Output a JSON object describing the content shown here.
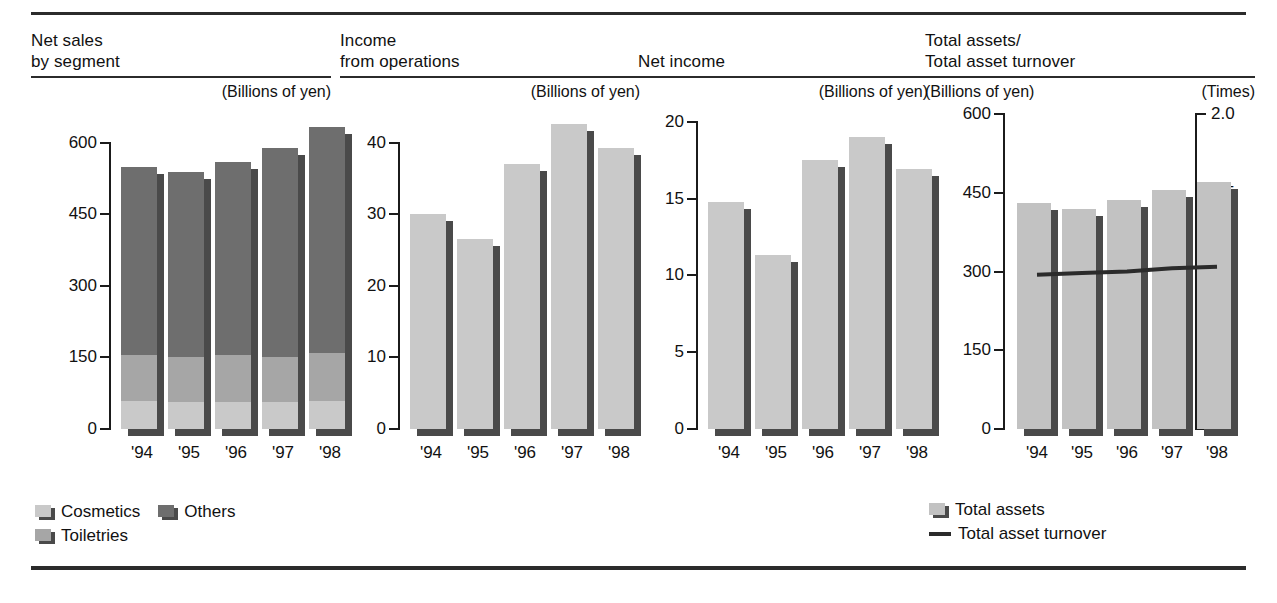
{
  "colors": {
    "cosmetics": "#c9c9c9",
    "toiletries": "#a6a6a6",
    "others": "#6e6e6e",
    "total_assets": "#c2c2c2",
    "bar_default": "#c9c9c9",
    "shadow": "#4a4a4a",
    "line": "#2b2b2b",
    "rule": "#2b2b2b"
  },
  "panels": [
    {
      "id": "net-sales-by-segment",
      "title": "Net sales\nby segment",
      "unit_left": "",
      "unit_right": "(Billions of yen)"
    },
    {
      "id": "income-from-operations",
      "title": "Income\nfrom operations",
      "unit_left": "",
      "unit_right": "(Billions of yen)"
    },
    {
      "id": "net-income",
      "title": "Net income",
      "unit_left": "",
      "unit_right": "(Billions of yen)"
    },
    {
      "id": "total-assets-turnover",
      "title": "Total assets/\nTotal asset turnover",
      "unit_left": "(Billions of yen)",
      "unit_right": "(Times)"
    }
  ],
  "legend1": {
    "items": [
      {
        "label": "Cosmetics",
        "swatch": "cosmetics"
      },
      {
        "label": "Others",
        "swatch": "others"
      },
      {
        "label": "Toiletries",
        "swatch": "toiletries"
      }
    ]
  },
  "legend4": {
    "items": [
      {
        "label": "Total assets",
        "swatch": "total_assets"
      },
      {
        "label": "Total asset turnover",
        "swatch": "line"
      }
    ]
  },
  "chart_data": [
    {
      "type": "bar",
      "stacked": true,
      "title": "Net sales by segment",
      "xlabel": "",
      "ylabel": "(Billions of yen)",
      "categories": [
        "'94",
        "'95",
        "'96",
        "'97",
        "'98"
      ],
      "yticks": [
        0,
        150,
        300,
        450,
        600
      ],
      "ylim": [
        0,
        660
      ],
      "grid": false,
      "legend_position": "bottom-left",
      "series": [
        {
          "name": "Cosmetics",
          "values": [
            58,
            56,
            56,
            56,
            59
          ]
        },
        {
          "name": "Toiletries",
          "values": [
            98,
            94,
            99,
            95,
            101
          ]
        },
        {
          "name": "Others",
          "values": [
            392,
            388,
            404,
            437,
            472
          ]
        }
      ],
      "totals": [
        548,
        538,
        559,
        588,
        632
      ]
    },
    {
      "type": "bar",
      "stacked": false,
      "title": "Income from operations",
      "xlabel": "",
      "ylabel": "(Billions of yen)",
      "categories": [
        "'94",
        "'95",
        "'96",
        "'97",
        "'98"
      ],
      "yticks": [
        0,
        10,
        20,
        30,
        40
      ],
      "ylim": [
        0,
        44
      ],
      "grid": false,
      "series": [
        {
          "name": "Income from operations",
          "values": [
            30.1,
            26.6,
            37.0,
            42.6,
            39.2
          ]
        }
      ]
    },
    {
      "type": "bar",
      "stacked": false,
      "title": "Net income",
      "xlabel": "",
      "ylabel": "(Billions of yen)",
      "categories": [
        "'94",
        "'95",
        "'96",
        "'97",
        "'98"
      ],
      "yticks": [
        0,
        5,
        10,
        15,
        20
      ],
      "ylim": [
        0,
        20.5
      ],
      "grid": false,
      "series": [
        {
          "name": "Net income",
          "values": [
            14.8,
            11.3,
            17.5,
            19.0,
            16.9
          ]
        }
      ]
    },
    {
      "type": "bar",
      "stacked": false,
      "combo": "line",
      "title": "Total assets / Total asset turnover",
      "xlabel": "",
      "ylabel": "(Billions of yen)",
      "y2label": "(Times)",
      "categories": [
        "'94",
        "'95",
        "'96",
        "'97",
        "'98"
      ],
      "yticks": [
        0,
        150,
        300,
        450,
        600
      ],
      "ylim": [
        0,
        600
      ],
      "y2ticks": [
        0,
        0.5,
        1.0,
        1.5,
        2.0
      ],
      "y2lim": [
        0,
        2.0
      ],
      "grid": false,
      "legend_position": "bottom-left",
      "series": [
        {
          "name": "Total assets",
          "type": "bar",
          "axis": "left",
          "values": [
            430,
            420,
            436,
            456,
            471
          ]
        },
        {
          "name": "Total asset turnover",
          "type": "line",
          "axis": "right",
          "values": [
            0.98,
            0.99,
            1.0,
            1.02,
            1.03
          ]
        }
      ]
    }
  ]
}
